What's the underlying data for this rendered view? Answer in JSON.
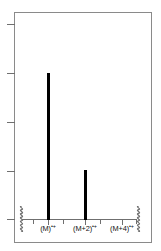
{
  "chart_data": {
    "type": "bar",
    "title": "",
    "subtitle": "",
    "xlabel": "",
    "ylabel": "",
    "categories": [
      "(M)⁺•",
      "(M+2)⁺•",
      "(M+4)⁺•"
    ],
    "category_labels_base": [
      "(M)",
      "(M+2)",
      "(M+4)"
    ],
    "category_labels_sup": [
      "•+",
      "•+",
      "•+"
    ],
    "values": [
      100,
      32,
      0
    ],
    "series": [
      {
        "name": "relative abundance",
        "values": [
          100,
          32,
          0
        ]
      }
    ],
    "ylim": [
      0,
      137
    ],
    "xlim": [
      0,
      5
    ],
    "grid": false,
    "legend": false,
    "legend_position": "none",
    "axis_break_left": true,
    "axis_break_right": true,
    "y_tick_count": 5,
    "y_tick_values": [
      "",
      "",
      "",
      "",
      ""
    ],
    "x_tick_count": 7,
    "annotations": []
  },
  "figure": {
    "width": 161,
    "height": 251,
    "background": "#ffffff",
    "frame_color": "#8a8a8a",
    "axis_color": "#6f6f6f",
    "peak_color": "#000000",
    "text_color": "#111111"
  },
  "axes": {
    "y_ticks": [
      {
        "name": "y-tick-1",
        "top": 24
      },
      {
        "name": "y-tick-2",
        "top": 73
      },
      {
        "name": "y-tick-3",
        "top": 122
      },
      {
        "name": "y-tick-4",
        "top": 171
      },
      {
        "name": "y-tick-5",
        "top": 219
      }
    ],
    "x_ticks": [
      {
        "name": "x-tick-m",
        "left": 48,
        "major": true
      },
      {
        "name": "x-tick-m1",
        "left": 63,
        "major": false
      },
      {
        "name": "x-tick-m2",
        "left": 85,
        "major": true
      },
      {
        "name": "x-tick-m3",
        "left": 100,
        "major": false
      },
      {
        "name": "x-tick-m4",
        "left": 122,
        "major": true
      },
      {
        "name": "x-tick-minor-a",
        "left": 33,
        "major": false
      },
      {
        "name": "x-tick-minor-b",
        "left": 136,
        "major": false
      }
    ]
  },
  "peaks": [
    {
      "name": "peak-m",
      "left": 47,
      "top": 73,
      "height": 147,
      "label_index": 0
    },
    {
      "name": "peak-m2",
      "left": 84,
      "top": 170,
      "height": 50,
      "label_index": 1
    }
  ],
  "labels": [
    {
      "name": "x-axis-label-m",
      "base": "(M)",
      "sup": "•+",
      "left": 48
    },
    {
      "name": "x-axis-label-m2",
      "base": "(M+2)",
      "sup": "•+",
      "left": 85
    },
    {
      "name": "x-axis-label-m4",
      "base": "(M+4)",
      "sup": "•+",
      "left": 122
    }
  ],
  "breaks": [
    {
      "name": "axis-break-left",
      "left": 17,
      "top": 206
    },
    {
      "name": "axis-break-right",
      "left": 134,
      "top": 206
    }
  ]
}
